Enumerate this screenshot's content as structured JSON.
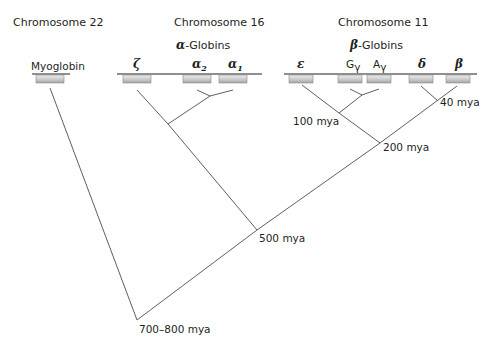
{
  "diagram": {
    "type": "phylogenetic-tree",
    "title": "",
    "chromosomes": [
      {
        "label": "Chromosome 22",
        "cluster": "",
        "genes": [
          {
            "label": "Myoglobin"
          }
        ]
      },
      {
        "label": "Chromosome 16",
        "cluster": {
          "symbol": "α",
          "suffix": "-Globins"
        },
        "genes": [
          {
            "label": "ζ",
            "sub": ""
          },
          {
            "label": "α",
            "sub": "2"
          },
          {
            "label": "α",
            "sub": "1"
          }
        ]
      },
      {
        "label": "Chromosome 11",
        "cluster": {
          "symbol": "β",
          "suffix": "-Globins"
        },
        "genes": [
          {
            "label": "ε",
            "sub": ""
          },
          {
            "label": "G",
            "sub": "γ"
          },
          {
            "label": "A",
            "sub": "γ"
          },
          {
            "label": "δ",
            "sub": ""
          },
          {
            "label": "β",
            "sub": ""
          }
        ]
      }
    ],
    "divergence_labels": [
      {
        "label": "40 mya",
        "node": "delta-beta"
      },
      {
        "label": "100 mya",
        "node": "epsilon-gamma"
      },
      {
        "label": "200 mya",
        "node": "beta-cluster"
      },
      {
        "label": "500 mya",
        "node": "alpha-beta"
      },
      {
        "label": "700–800 mya",
        "node": "myoglobin-hemoglobin"
      }
    ],
    "colors": {
      "line": "#4d4d4f",
      "text": "#231f20",
      "gene_top": "#e6e6e6",
      "gene_bottom": "#a7a7a7"
    }
  }
}
